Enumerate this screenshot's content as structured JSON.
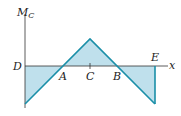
{
  "diagram": {
    "y_axis_label": "M",
    "y_axis_subscript": "C",
    "x_axis_label": "x",
    "points": {
      "D": "D",
      "A": "A",
      "C": "C",
      "B": "B",
      "E": "E"
    },
    "colors": {
      "line": "#1a8fa8",
      "fill": "#bfe0ec",
      "axis": "#333333"
    }
  }
}
